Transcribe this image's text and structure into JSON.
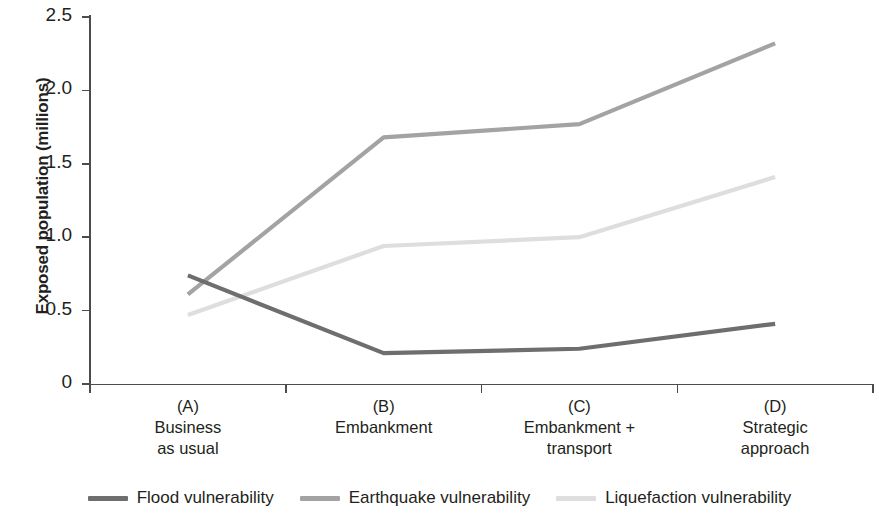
{
  "chart_data": {
    "type": "line",
    "title": "",
    "xlabel": "",
    "ylabel": "Exposed population (millions)",
    "categories": [
      "(A) Business as usual",
      "(B) Embankment",
      "(C) Embankment + transport",
      "(D) Strategic approach"
    ],
    "category_lines": [
      [
        "(A)",
        "Business",
        "as usual"
      ],
      [
        "(B)",
        "Embankment",
        ""
      ],
      [
        "(C)",
        "Embankment +",
        "transport"
      ],
      [
        "(D)",
        "Strategic",
        "approach"
      ]
    ],
    "series": [
      {
        "name": "Flood vulnerability",
        "color": "#6e6e6e",
        "values": [
          0.74,
          0.21,
          0.24,
          0.41
        ]
      },
      {
        "name": "Earthquake vulnerability",
        "color": "#a3a3a3",
        "values": [
          0.61,
          1.68,
          1.77,
          2.32
        ]
      },
      {
        "name": "Liquefaction vulnerability",
        "color": "#dedede",
        "values": [
          0.47,
          0.94,
          1.0,
          1.41
        ]
      }
    ],
    "ylim": [
      0,
      2.5
    ],
    "yticks": [
      0,
      0.5,
      1.0,
      1.5,
      2.0,
      2.5
    ],
    "ytick_labels": [
      "0",
      "0.5",
      "1.0",
      "1.5",
      "2.0",
      "2.5"
    ],
    "grid": false,
    "legend_position": "bottom"
  },
  "legend": {
    "items": [
      {
        "label": "Flood vulnerability",
        "color": "#6e6e6e"
      },
      {
        "label": "Earthquake vulnerability",
        "color": "#a3a3a3"
      },
      {
        "label": "Liquefaction vulnerability",
        "color": "#dedede"
      }
    ]
  }
}
